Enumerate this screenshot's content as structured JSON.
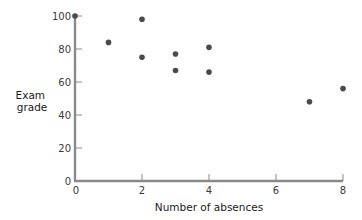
{
  "chart_data": {
    "type": "scatter",
    "title": "",
    "xlabel": "Number of absences",
    "ylabel": "Exam grade",
    "xlim": [
      0,
      8
    ],
    "ylim": [
      0,
      100
    ],
    "xticks": [
      0,
      2,
      4,
      6,
      8
    ],
    "yticks": [
      0,
      20,
      40,
      60,
      80,
      100
    ],
    "grid": false,
    "legend": null,
    "series": [
      {
        "name": "students",
        "points": [
          {
            "x": 0,
            "y": 100
          },
          {
            "x": 1,
            "y": 84
          },
          {
            "x": 2,
            "y": 98
          },
          {
            "x": 2,
            "y": 75
          },
          {
            "x": 3,
            "y": 77
          },
          {
            "x": 3,
            "y": 67
          },
          {
            "x": 4,
            "y": 81
          },
          {
            "x": 4,
            "y": 66
          },
          {
            "x": 7,
            "y": 48
          },
          {
            "x": 8,
            "y": 56
          }
        ]
      }
    ]
  },
  "colors": {
    "axis": "#8a8a8a",
    "point": "#4a4a4a",
    "tick_text": "#3a3a3a",
    "title_text": "#1a1a1a"
  },
  "ylabel_lines": [
    "Exam",
    "grade"
  ]
}
